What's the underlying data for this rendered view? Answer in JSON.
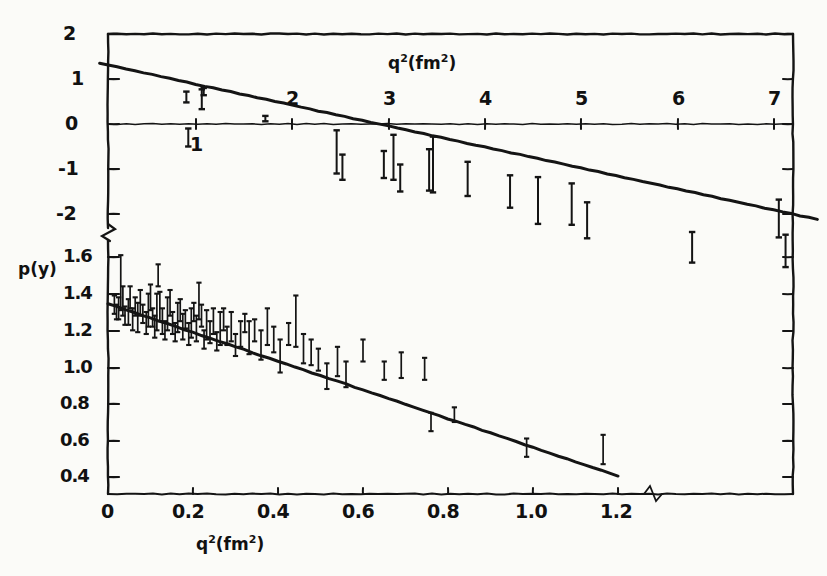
{
  "figure": {
    "name": "form-factor-plot",
    "background_color": "#fbfbf8",
    "ink_color": "#141414"
  },
  "axes": {
    "y_left_upper": {
      "name": "upper-y-axis",
      "ticks": [
        "2",
        "1",
        "0",
        "-1",
        "-2"
      ],
      "values": [
        2,
        1,
        0,
        -1,
        -2
      ],
      "pixel_y": [
        34,
        79,
        124,
        169,
        214
      ]
    },
    "y_left_lower": {
      "name": "lower-y-axis",
      "label": "p(y)",
      "ticks": [
        "1.6",
        "1.4",
        "1.2",
        "1.0",
        "0.8",
        "0.6",
        "0.4"
      ],
      "values": [
        1.6,
        1.4,
        1.2,
        1.0,
        0.8,
        0.6,
        0.4
      ],
      "pixel_y": [
        257,
        294,
        331,
        368,
        404,
        441,
        477
      ]
    },
    "x_top": {
      "name": "upper-x-axis",
      "title": "q2 (fm2)",
      "title_base": "q",
      "title_sup": "2",
      "title_unit_open": "(fm",
      "title_unit_sup": "2",
      "title_unit_close": ")",
      "ticks": [
        "1",
        "2",
        "3",
        "4",
        "5",
        "6",
        "7"
      ],
      "values": [
        1,
        2,
        3,
        4,
        5,
        6,
        7
      ],
      "pixel_x": [
        196,
        292,
        389,
        485,
        581,
        678,
        774
      ]
    },
    "x_bottom": {
      "name": "lower-x-axis",
      "title": "q2 (fm2)",
      "title_base": "q",
      "title_sup": "2",
      "title_unit_open": "(fm",
      "title_unit_sup": "2",
      "title_unit_close": ")",
      "ticks": [
        "0",
        "0.2",
        "0.4",
        "0.6",
        "0.8",
        "1.0",
        "1.2"
      ],
      "values": [
        0,
        0.2,
        0.4,
        0.6,
        0.8,
        1.0,
        1.2
      ],
      "pixel_x": [
        108,
        193,
        278,
        363,
        448,
        533,
        618
      ]
    },
    "breaks": [
      {
        "name": "y-axis-break",
        "x": 108,
        "y": 232
      },
      {
        "name": "x-axis-break",
        "x": 653,
        "y": 494
      }
    ]
  },
  "chart_data": {
    "type": "scatter",
    "title": "",
    "xlabel": "q² (fm²)",
    "ylabel": "p(y)",
    "grid": false,
    "legend": null,
    "panels": [
      {
        "name": "upper-panel",
        "xlabel": "q² (fm²)",
        "ylabel": "",
        "xlim": [
          0,
          7.45
        ],
        "ylim": [
          -2.3,
          2.0
        ],
        "fit_line": {
          "x0": 0.0,
          "y0": 1.35,
          "x1": 7.45,
          "y1": -2.12
        },
        "points": [
          {
            "x": 0.9,
            "y": 0.6,
            "err": 0.12
          },
          {
            "x": 1.06,
            "y": 0.55,
            "err": 0.22
          },
          {
            "x": 1.08,
            "y": 0.72,
            "err": 0.08
          },
          {
            "x": 1.72,
            "y": 0.12,
            "err": 0.06
          },
          {
            "x": 0.92,
            "y": -0.3,
            "err": 0.2
          },
          {
            "x": 2.46,
            "y": -0.62,
            "err": 0.48
          },
          {
            "x": 2.52,
            "y": -0.96,
            "err": 0.28
          },
          {
            "x": 2.95,
            "y": -0.9,
            "err": 0.3
          },
          {
            "x": 3.05,
            "y": -0.74,
            "err": 0.5
          },
          {
            "x": 3.12,
            "y": -1.2,
            "err": 0.3
          },
          {
            "x": 3.42,
            "y": -1.02,
            "err": 0.46
          },
          {
            "x": 3.46,
            "y": -0.9,
            "err": 0.62
          },
          {
            "x": 3.82,
            "y": -1.22,
            "err": 0.38
          },
          {
            "x": 4.26,
            "y": -1.5,
            "err": 0.36
          },
          {
            "x": 4.55,
            "y": -1.7,
            "err": 0.52
          },
          {
            "x": 4.9,
            "y": -1.78,
            "err": 0.46
          },
          {
            "x": 5.06,
            "y": -2.14,
            "err": 0.4
          },
          {
            "x": 6.15,
            "y": -2.74,
            "err": 0.34
          },
          {
            "x": 7.05,
            "y": -2.1,
            "err": 0.42
          },
          {
            "x": 7.12,
            "y": -2.82,
            "err": 0.36
          }
        ]
      },
      {
        "name": "lower-panel",
        "xlabel": "q² (fm²)",
        "ylabel": "p(y)",
        "xlim": [
          0,
          1.45
        ],
        "ylim": [
          0.3,
          1.66
        ],
        "fit_line": {
          "x0": 0.0,
          "y0": 1.345,
          "x1": 1.2,
          "y1": 0.405
        },
        "points": [
          {
            "x": 0.015,
            "y": 1.34,
            "err": 0.05
          },
          {
            "x": 0.02,
            "y": 1.3,
            "err": 0.04
          },
          {
            "x": 0.025,
            "y": 1.32,
            "err": 0.06
          },
          {
            "x": 0.03,
            "y": 1.46,
            "err": 0.15
          },
          {
            "x": 0.035,
            "y": 1.36,
            "err": 0.08
          },
          {
            "x": 0.04,
            "y": 1.28,
            "err": 0.05
          },
          {
            "x": 0.048,
            "y": 1.3,
            "err": 0.07
          },
          {
            "x": 0.052,
            "y": 1.38,
            "err": 0.06
          },
          {
            "x": 0.058,
            "y": 1.26,
            "err": 0.06
          },
          {
            "x": 0.064,
            "y": 1.33,
            "err": 0.05
          },
          {
            "x": 0.07,
            "y": 1.27,
            "err": 0.08
          },
          {
            "x": 0.076,
            "y": 1.35,
            "err": 0.07
          },
          {
            "x": 0.082,
            "y": 1.29,
            "err": 0.05
          },
          {
            "x": 0.09,
            "y": 1.24,
            "err": 0.06
          },
          {
            "x": 0.095,
            "y": 1.31,
            "err": 0.09
          },
          {
            "x": 0.1,
            "y": 1.38,
            "err": 0.07
          },
          {
            "x": 0.105,
            "y": 1.27,
            "err": 0.05
          },
          {
            "x": 0.11,
            "y": 1.22,
            "err": 0.06
          },
          {
            "x": 0.115,
            "y": 1.3,
            "err": 0.1
          },
          {
            "x": 0.118,
            "y": 1.5,
            "err": 0.06
          },
          {
            "x": 0.122,
            "y": 1.33,
            "err": 0.08
          },
          {
            "x": 0.128,
            "y": 1.25,
            "err": 0.07
          },
          {
            "x": 0.134,
            "y": 1.2,
            "err": 0.05
          },
          {
            "x": 0.14,
            "y": 1.29,
            "err": 0.09
          },
          {
            "x": 0.146,
            "y": 1.35,
            "err": 0.07
          },
          {
            "x": 0.152,
            "y": 1.24,
            "err": 0.06
          },
          {
            "x": 0.158,
            "y": 1.19,
            "err": 0.05
          },
          {
            "x": 0.164,
            "y": 1.27,
            "err": 0.08
          },
          {
            "x": 0.17,
            "y": 1.31,
            "err": 0.06
          },
          {
            "x": 0.176,
            "y": 1.22,
            "err": 0.07
          },
          {
            "x": 0.182,
            "y": 1.26,
            "err": 0.05
          },
          {
            "x": 0.19,
            "y": 1.18,
            "err": 0.06
          },
          {
            "x": 0.196,
            "y": 1.24,
            "err": 0.08
          },
          {
            "x": 0.202,
            "y": 1.3,
            "err": 0.05
          },
          {
            "x": 0.208,
            "y": 1.21,
            "err": 0.07
          },
          {
            "x": 0.214,
            "y": 1.36,
            "err": 0.1
          },
          {
            "x": 0.22,
            "y": 1.28,
            "err": 0.06
          },
          {
            "x": 0.226,
            "y": 1.15,
            "err": 0.05
          },
          {
            "x": 0.232,
            "y": 1.23,
            "err": 0.08
          },
          {
            "x": 0.24,
            "y": 1.19,
            "err": 0.06
          },
          {
            "x": 0.248,
            "y": 1.25,
            "err": 0.07
          },
          {
            "x": 0.256,
            "y": 1.14,
            "err": 0.05
          },
          {
            "x": 0.264,
            "y": 1.21,
            "err": 0.09
          },
          {
            "x": 0.272,
            "y": 1.26,
            "err": 0.06
          },
          {
            "x": 0.28,
            "y": 1.17,
            "err": 0.05
          },
          {
            "x": 0.29,
            "y": 1.22,
            "err": 0.08
          },
          {
            "x": 0.3,
            "y": 1.12,
            "err": 0.06
          },
          {
            "x": 0.312,
            "y": 1.18,
            "err": 0.07
          },
          {
            "x": 0.322,
            "y": 1.24,
            "err": 0.05
          },
          {
            "x": 0.332,
            "y": 1.16,
            "err": 0.09
          },
          {
            "x": 0.345,
            "y": 1.2,
            "err": 0.06
          },
          {
            "x": 0.36,
            "y": 1.12,
            "err": 0.08
          },
          {
            "x": 0.375,
            "y": 1.22,
            "err": 0.1
          },
          {
            "x": 0.39,
            "y": 1.15,
            "err": 0.07
          },
          {
            "x": 0.405,
            "y": 1.06,
            "err": 0.09
          },
          {
            "x": 0.425,
            "y": 1.18,
            "err": 0.06
          },
          {
            "x": 0.442,
            "y": 1.25,
            "err": 0.14
          },
          {
            "x": 0.46,
            "y": 1.1,
            "err": 0.08
          },
          {
            "x": 0.478,
            "y": 1.08,
            "err": 0.07
          },
          {
            "x": 0.495,
            "y": 1.04,
            "err": 0.06
          },
          {
            "x": 0.515,
            "y": 0.95,
            "err": 0.07
          },
          {
            "x": 0.54,
            "y": 1.03,
            "err": 0.08
          },
          {
            "x": 0.56,
            "y": 0.96,
            "err": 0.07
          },
          {
            "x": 0.6,
            "y": 1.09,
            "err": 0.06
          },
          {
            "x": 0.65,
            "y": 0.98,
            "err": 0.05
          },
          {
            "x": 0.69,
            "y": 1.01,
            "err": 0.07
          },
          {
            "x": 0.745,
            "y": 0.99,
            "err": 0.06
          },
          {
            "x": 0.76,
            "y": 0.7,
            "err": 0.05
          },
          {
            "x": 0.815,
            "y": 0.74,
            "err": 0.04
          },
          {
            "x": 0.985,
            "y": 0.56,
            "err": 0.05
          },
          {
            "x": 1.165,
            "y": 0.55,
            "err": 0.08
          }
        ]
      }
    ]
  }
}
